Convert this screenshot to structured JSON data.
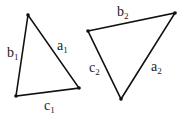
{
  "diagram": {
    "triangles": [
      {
        "id": "triangle-1",
        "vertices": [
          [
            28,
            15
          ],
          [
            16,
            96
          ],
          [
            79,
            88
          ]
        ],
        "labels": {
          "a": {
            "base": "a",
            "sub": "1",
            "x": 57,
            "y": 50
          },
          "b": {
            "base": "b",
            "sub": "1",
            "x": 7,
            "y": 57
          },
          "c": {
            "base": "c",
            "sub": "1",
            "x": 44,
            "y": 110
          }
        }
      },
      {
        "id": "triangle-2",
        "vertices": [
          [
            88,
            31
          ],
          [
            175,
            13
          ],
          [
            121,
            99
          ]
        ],
        "labels": {
          "a": {
            "base": "a",
            "sub": "2",
            "x": 151,
            "y": 71
          },
          "b": {
            "base": "b",
            "sub": "2",
            "x": 117,
            "y": 16
          },
          "c": {
            "base": "c",
            "sub": "2",
            "x": 89,
            "y": 72
          }
        }
      }
    ],
    "stroke_color": "#111111",
    "background": "#ffffff"
  }
}
